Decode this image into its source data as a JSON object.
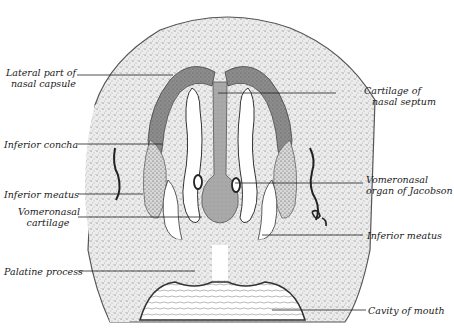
{
  "figure": {
    "colors": {
      "background": "#ffffff",
      "tissue": "#e9e9e9",
      "stipple": "#4a4a4a",
      "cartilage": "#8a8a8a",
      "cartilage_dark": "#5c5c5c",
      "leader_line": "#222222",
      "label_text": "#1a1a1a"
    }
  },
  "labels": {
    "lateral_part_of_nasal_capsule": {
      "line1": "Lateral part of",
      "line2": "nasal capsule"
    },
    "cartilage_of_nasal_septum": {
      "line1": "Cartilage of",
      "line2": "nasal septum"
    },
    "inferior_concha": {
      "line1": "Inferior concha"
    },
    "inferior_meatus_left": {
      "line1": "Inferior meatus"
    },
    "vomeronasal_cartilage": {
      "line1": "Vomeronasal",
      "line2": "cartilage"
    },
    "vomeronasal_organ": {
      "line1": "Vomeronasal",
      "line2": "organ of Jacobson"
    },
    "inferior_meatus_right": {
      "line1": "Inferior meatus"
    },
    "palatine_process": {
      "line1": "Palatine process"
    },
    "cavity_of_mouth": {
      "line1": "Cavity of mouth"
    }
  }
}
